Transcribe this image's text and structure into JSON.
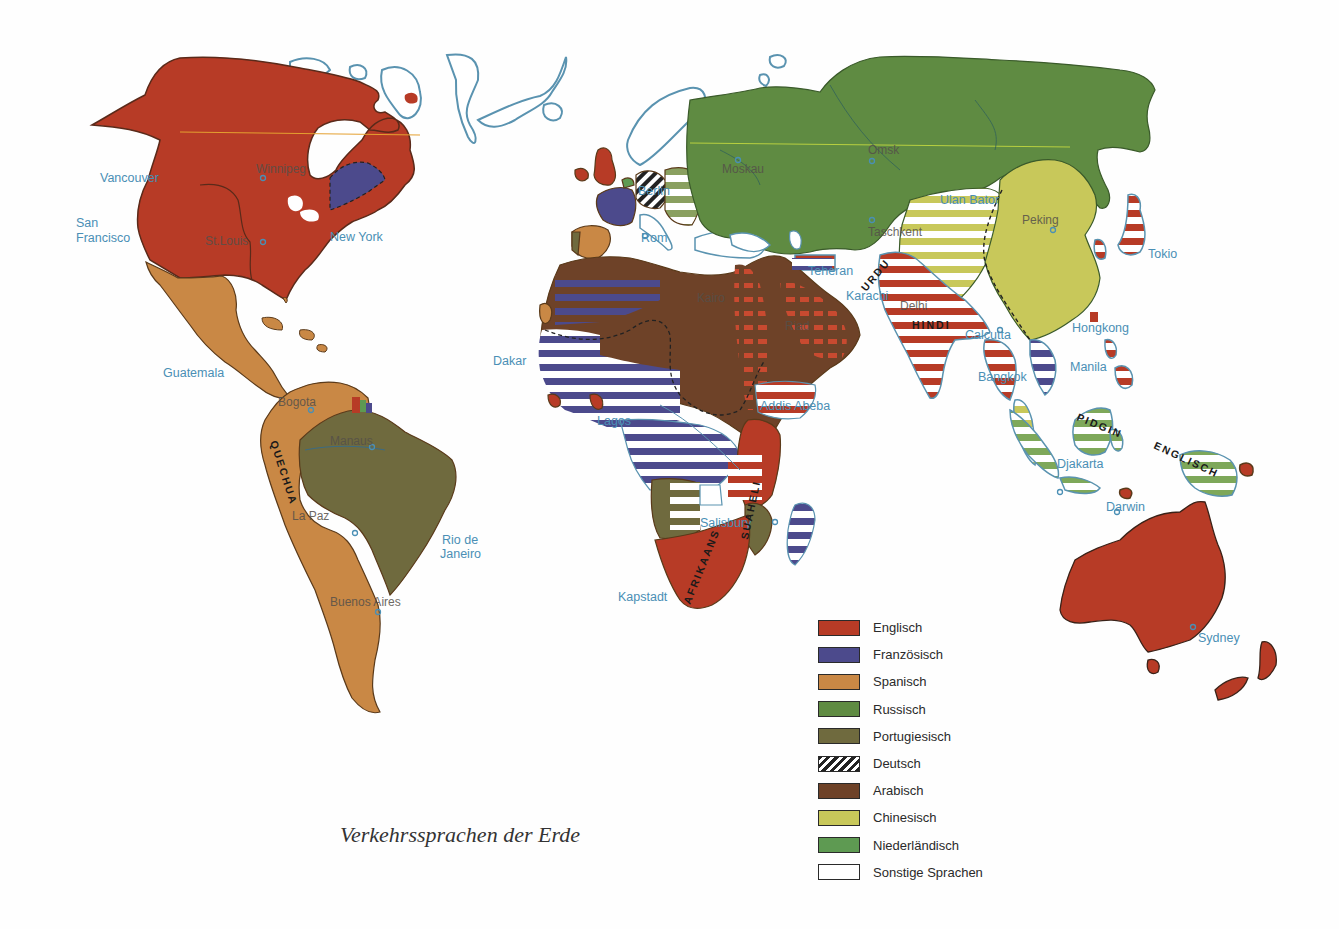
{
  "title": "Verkehrssprachen der Erde",
  "legend": [
    {
      "label": "Englisch",
      "color": "#b73b26",
      "pattern": "solid"
    },
    {
      "label": "Französisch",
      "color": "#4c4a8c",
      "pattern": "solid"
    },
    {
      "label": "Spanisch",
      "color": "#c98845",
      "pattern": "solid"
    },
    {
      "label": "Russisch",
      "color": "#5f8b42",
      "pattern": "solid"
    },
    {
      "label": "Portugiesisch",
      "color": "#6f6a3e",
      "pattern": "solid"
    },
    {
      "label": "Deutsch",
      "color": "#222222",
      "pattern": "hatched"
    },
    {
      "label": "Arabisch",
      "color": "#6e4228",
      "pattern": "solid"
    },
    {
      "label": "Chinesisch",
      "color": "#c8c85a",
      "pattern": "solid"
    },
    {
      "label": "Niederländisch",
      "color": "#5e9a52",
      "pattern": "solid"
    },
    {
      "label": "Sonstige Sprachen",
      "color": "#ffffff",
      "pattern": "solid"
    }
  ],
  "cities": {
    "vancouver": "Vancouver",
    "san_francisco_1": "San",
    "san_francisco_2": "Francisco",
    "winnipeg": "Winnipeg",
    "st_louis": "St.Louis",
    "new_york": "New York",
    "guatemala": "Guatemala",
    "bogota": "Bogota",
    "manaus": "Manaus",
    "la_paz": "La Paz",
    "rio_1": "Rio de",
    "rio_2": "Janeiro",
    "buenos_aires": "Buenos Aires",
    "berlin": "Berlin",
    "rom": "Rom",
    "moskau": "Moskau",
    "omsk": "Omsk",
    "taschkent": "Taschkent",
    "ulan_bator": "Ulan Bator",
    "peking": "Peking",
    "tokio": "Tokio",
    "teheran": "Teheran",
    "karachi": "Karachi",
    "delhi": "Delhi",
    "calcutta": "Calcutta",
    "hongkong": "Hongkong",
    "bangkok": "Bangkok",
    "manila": "Manila",
    "djakarta": "Djakarta",
    "darwin": "Darwin",
    "sydney": "Sydney",
    "dakar": "Dakar",
    "lagos": "Lagos",
    "kairo": "Kairo",
    "riad": "Riad",
    "addis_abeba": "Addis Abeba",
    "salisbury": "Salisbury",
    "kapstadt": "Kapstadt"
  },
  "language_labels": {
    "quechua": "QUECHUA",
    "urdu": "URDU",
    "hindi": "HINDI",
    "pidgin": "PIDGIN",
    "englisch": "ENGLISCH",
    "afrikaans": "AFRIKAANS",
    "suaheli": "SUAHELI"
  }
}
